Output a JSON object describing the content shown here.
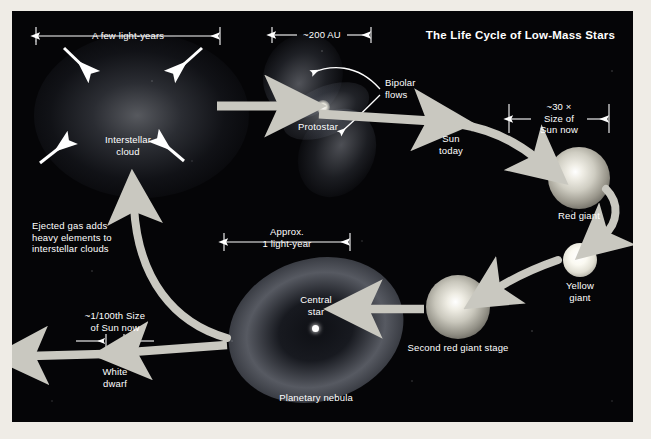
{
  "figure": {
    "title": "The Life Cycle of Low-Mass Stars",
    "background_color": "#050507",
    "arrow_color": "#c9c8c0",
    "text_color": "#ffffff",
    "width": 651,
    "height": 439
  },
  "stages": [
    {
      "id": "interstellar-cloud",
      "label": "Interstellar\ncloud",
      "scale_label": "A few light-years",
      "description": "Diffuse glowing cloud with four inward collapse arrows"
    },
    {
      "id": "protostar",
      "label": "Protostar",
      "scale_label": "~200 AU",
      "annotation": "Bipolar\nflows"
    },
    {
      "id": "sun-today",
      "label": "Sun\ntoday"
    },
    {
      "id": "red-giant",
      "label": "Red giant",
      "scale_label": "~30 ×\nSize of\nSun now"
    },
    {
      "id": "yellow-giant",
      "label": "Yellow\ngiant"
    },
    {
      "id": "second-red-giant",
      "label": "Second red giant stage"
    },
    {
      "id": "planetary-nebula",
      "label": "Planetary nebula",
      "scale_label": "Approx.\n1 light-year",
      "central_star_label": "Central\nstar"
    },
    {
      "id": "white-dwarf",
      "label": "White\ndwarf",
      "scale_label": "~1/100th Size\nof Sun now"
    }
  ],
  "notes": {
    "ejected_gas": "Ejected gas adds\nheavy elements to\ninterstellar clouds"
  }
}
